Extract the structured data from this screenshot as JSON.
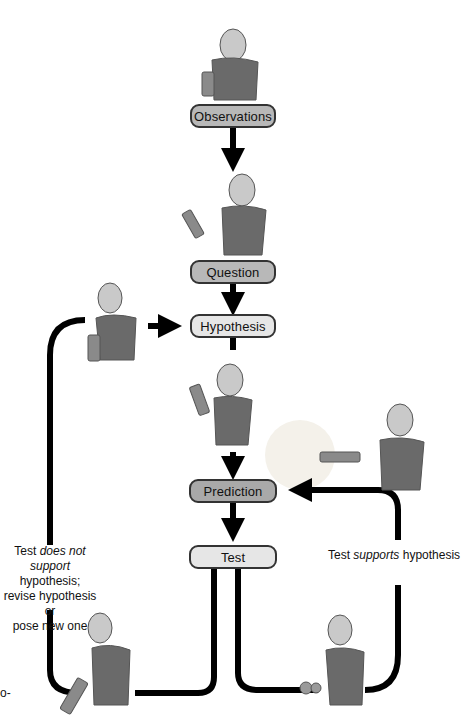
{
  "diagram": {
    "nodes": [
      {
        "id": "observations",
        "label": "Observations",
        "fill": "#b8b8b8"
      },
      {
        "id": "question",
        "label": "Question",
        "fill": "#b8b8b8"
      },
      {
        "id": "hypothesis",
        "label": "Hypothesis",
        "fill": "#e6e6e6"
      },
      {
        "id": "prediction",
        "label": "Prediction",
        "fill": "#a9a9a9"
      },
      {
        "id": "test",
        "label": "Test",
        "fill": "#e6e6e6"
      }
    ],
    "edges": [
      {
        "from": "observations",
        "to": "question"
      },
      {
        "from": "question",
        "to": "hypothesis"
      },
      {
        "from": "hypothesis",
        "to": "prediction"
      },
      {
        "from": "prediction",
        "to": "test"
      },
      {
        "from": "test",
        "to": "hypothesis",
        "label": "not-supported"
      },
      {
        "from": "test",
        "to": "prediction",
        "label": "supported"
      }
    ],
    "labels": {
      "not_supported": {
        "pre": "Test ",
        "em": "does not",
        "mid_em": "support",
        "rest": " hypothesis;",
        "line3": "revise hypothesis or",
        "line4": "pose new one"
      },
      "supported": {
        "pre": "Test ",
        "em": "supports",
        "rest": " hypothesis"
      },
      "edge_fragment": "o-"
    },
    "illustrations": [
      "woman-holding-flashlight-observing",
      "woman-thinking-question",
      "woman-holding-flashlight-revising",
      "woman-idea-hypothesis",
      "woman-shining-flashlight",
      "woman-examining-flashlight-fail",
      "woman-examining-flashlight-success"
    ]
  }
}
